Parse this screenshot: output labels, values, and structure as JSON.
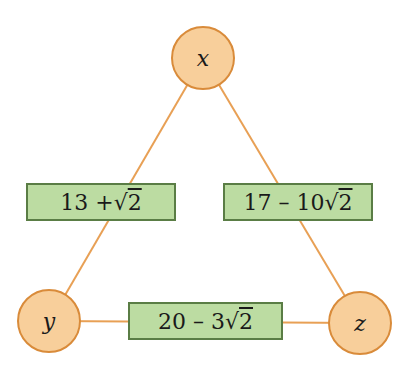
{
  "diagram": {
    "colors": {
      "node_fill": "#f8cf9b",
      "node_border": "#d98b3a",
      "edge": "#e8a055",
      "label_fill": "#bcdca2",
      "label_border": "#5a7d45"
    },
    "nodes": [
      {
        "id": "x",
        "label": "x"
      },
      {
        "id": "y",
        "label": "y"
      },
      {
        "id": "z",
        "label": "z"
      }
    ],
    "edges": [
      {
        "from": "x",
        "to": "y",
        "label_prefix": "13 + ",
        "label_root": "√",
        "label_radicand": "2"
      },
      {
        "from": "x",
        "to": "z",
        "label_prefix": "17 – 10 ",
        "label_root": "√",
        "label_radicand": "2"
      },
      {
        "from": "y",
        "to": "z",
        "label_prefix": "20 – 3 ",
        "label_root": "√",
        "label_radicand": "2"
      }
    ]
  }
}
